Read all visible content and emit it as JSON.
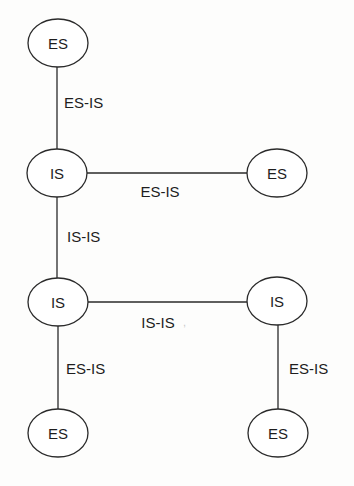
{
  "diagram": {
    "type": "network-topology",
    "nodes": [
      {
        "id": "es_top",
        "label": "ES",
        "cx": 58,
        "cy": 43,
        "rx": 30,
        "ry": 24
      },
      {
        "id": "is_mid_left",
        "label": "IS",
        "cx": 57,
        "cy": 173,
        "rx": 30,
        "ry": 24
      },
      {
        "id": "es_mid_right",
        "label": "ES",
        "cx": 277,
        "cy": 173,
        "rx": 30,
        "ry": 24
      },
      {
        "id": "is_low_left",
        "label": "IS",
        "cx": 58,
        "cy": 302,
        "rx": 30,
        "ry": 24
      },
      {
        "id": "is_low_right",
        "label": "IS",
        "cx": 277,
        "cy": 301,
        "rx": 30,
        "ry": 24
      },
      {
        "id": "es_bottom_left",
        "label": "ES",
        "cx": 58,
        "cy": 433,
        "rx": 30,
        "ry": 24
      },
      {
        "id": "es_bottom_right",
        "label": "ES",
        "cx": 278,
        "cy": 433,
        "rx": 30,
        "ry": 24
      }
    ],
    "edges": [
      {
        "from": "es_top",
        "to": "is_mid_left",
        "label": "ES-IS",
        "x1": 57,
        "y1": 67,
        "x2": 57,
        "y2": 149,
        "label_x": 64,
        "label_y": 102,
        "anchor": "start"
      },
      {
        "from": "is_mid_left",
        "to": "es_mid_right",
        "label": "ES-IS",
        "x1": 87,
        "y1": 173,
        "x2": 247,
        "y2": 173,
        "label_x": 160,
        "label_y": 191,
        "anchor": "center"
      },
      {
        "from": "is_mid_left",
        "to": "is_low_left",
        "label": "IS-IS",
        "x1": 57,
        "y1": 197,
        "x2": 57,
        "y2": 278,
        "label_x": 67,
        "label_y": 236,
        "anchor": "start"
      },
      {
        "from": "is_low_left",
        "to": "is_low_right",
        "label": "IS-IS",
        "x1": 88,
        "y1": 302,
        "x2": 247,
        "y2": 302,
        "label_x": 158,
        "label_y": 322,
        "anchor": "center"
      },
      {
        "from": "is_low_left",
        "to": "es_bottom_left",
        "label": "ES-IS",
        "x1": 58,
        "y1": 326,
        "x2": 58,
        "y2": 409,
        "label_x": 66,
        "label_y": 368,
        "anchor": "start"
      },
      {
        "from": "is_low_right",
        "to": "es_bottom_right",
        "label": "ES-IS",
        "x1": 278,
        "y1": 325,
        "x2": 278,
        "y2": 409,
        "label_x": 289,
        "label_y": 368,
        "anchor": "start"
      }
    ],
    "colors": {
      "stroke": "#2a2a2a",
      "text": "#1e1e1e",
      "background": "#fdfdfc"
    }
  }
}
